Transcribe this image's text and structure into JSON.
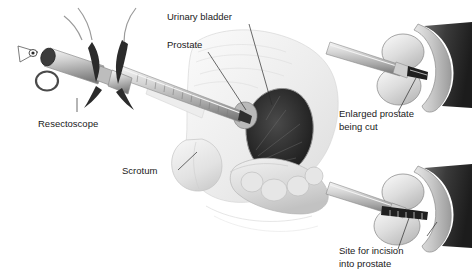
{
  "figure": {
    "background_color": "#ffffff",
    "width": 472,
    "height": 275
  },
  "panels": {
    "main": {
      "name": "main-sagittal-view",
      "description": "Sagittal section of male pelvis with resectoscope inserted through urethra"
    },
    "upper_right": {
      "name": "enlarged-prostate-detail",
      "description": "Close-up of resectoscope loop cutting enlarged prostate lobes"
    },
    "lower_right": {
      "name": "incision-site-detail",
      "description": "Close-up showing site for incision into prostate"
    }
  },
  "labels": [
    {
      "id": "resectoscope",
      "text": "Resectoscope",
      "x": 38,
      "y": 127,
      "anchor": "start"
    },
    {
      "id": "urinary-bladder",
      "text": "Urinary bladder",
      "x": 167,
      "y": 20,
      "anchor": "start"
    },
    {
      "id": "prostate",
      "text": "Prostate",
      "x": 167,
      "y": 48,
      "anchor": "start"
    },
    {
      "id": "scrotum",
      "text": "Scrotum",
      "x": 122,
      "y": 174,
      "anchor": "start"
    },
    {
      "id": "enlarged-prostate-line1",
      "text": "Enlarged prostate",
      "x": 339,
      "y": 117,
      "anchor": "start"
    },
    {
      "id": "enlarged-prostate-line2",
      "text": "being cut",
      "x": 339,
      "y": 130,
      "anchor": "start"
    },
    {
      "id": "incision-site-line1",
      "text": "Site for incision",
      "x": 339,
      "y": 254,
      "anchor": "start"
    },
    {
      "id": "incision-site-line2",
      "text": "into prostate",
      "x": 339,
      "y": 267,
      "anchor": "start"
    }
  ],
  "colors": {
    "text": "#1a1a1a",
    "leader_line": "#2b2b2b",
    "tissue_light": "#f0f0f0",
    "tissue_mid": "#d4d4d4",
    "tissue_dark": "#9a9a9a",
    "cavity_dark": "#2e2e2e",
    "instrument_metal": "#c9c9c9",
    "instrument_dark": "#3a3a3a",
    "outline": "#8a8a8a"
  }
}
